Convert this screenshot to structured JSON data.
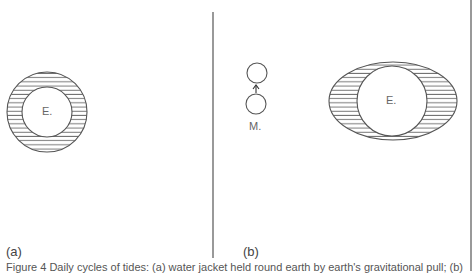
{
  "figure": {
    "panels": [
      {
        "id": "a",
        "label": "(a)",
        "earth_label": "E."
      },
      {
        "id": "b",
        "label": "(b)",
        "earth_label": "E.",
        "moon_label": "M."
      }
    ],
    "caption": "Figure 4 Daily cycles of tides: (a) water jacket held round earth by earth's gravitational pull; (b)",
    "colors": {
      "line": "#555555",
      "hatch": "#666666",
      "background": "#ffffff"
    }
  }
}
